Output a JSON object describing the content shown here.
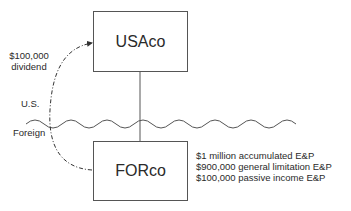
{
  "diagram": {
    "entities": {
      "parent": {
        "label": "USAco"
      },
      "subsidiary": {
        "label": "FORco"
      }
    },
    "arrow": {
      "amount": "$100,000",
      "type": "dividend",
      "style": "dash-dot",
      "from": "FORco",
      "to": "USAco"
    },
    "border": {
      "upper_label": "U.S.",
      "lower_label": "Foreign"
    },
    "ep_notes": [
      "$1 million accumulated E&P",
      "$900,000 general limitation E&P",
      "$100,000 passive income E&P"
    ],
    "colors": {
      "line": "#555555",
      "text": "#2a2a2a",
      "background": "#ffffff"
    }
  }
}
